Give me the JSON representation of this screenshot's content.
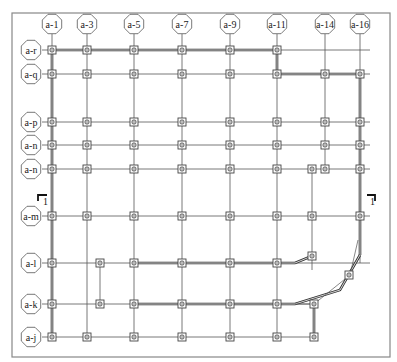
{
  "drawing": {
    "type": "structural grid plan",
    "frame": {
      "x": 12,
      "y": 13,
      "width": 378,
      "height": 344
    },
    "colors": {
      "line": "#555555",
      "wall": "#333333",
      "bubble_fill": "#ffffff",
      "column_fill": "#bbbbbb",
      "frame": "#888888"
    },
    "columns_axes": [
      {
        "label": "a-1",
        "x": 52
      },
      {
        "label": "a-3",
        "x": 87
      },
      {
        "label": "a-5",
        "x": 134
      },
      {
        "label": "a-7",
        "x": 182
      },
      {
        "label": "a-9",
        "x": 230
      },
      {
        "label": "a-11",
        "x": 277
      },
      {
        "label": "a-14",
        "x": 325
      },
      {
        "label": "a-16",
        "x": 360
      }
    ],
    "row_axes": [
      {
        "label": "a-r",
        "y": 50
      },
      {
        "label": "a-q",
        "y": 74
      },
      {
        "label": "a-p",
        "y": 122
      },
      {
        "label": "a-n",
        "y": 145
      },
      {
        "label": "a-n",
        "y": 169
      },
      {
        "label": "a-m",
        "y": 216
      },
      {
        "label": "a-l",
        "y": 263
      },
      {
        "label": "a-k",
        "y": 304
      },
      {
        "label": "a-j",
        "y": 337
      }
    ],
    "section_marks": [
      {
        "label": "1",
        "x": 38,
        "y": 195,
        "side": "left"
      },
      {
        "label": "1",
        "x": 375,
        "y": 195,
        "side": "right"
      }
    ]
  }
}
